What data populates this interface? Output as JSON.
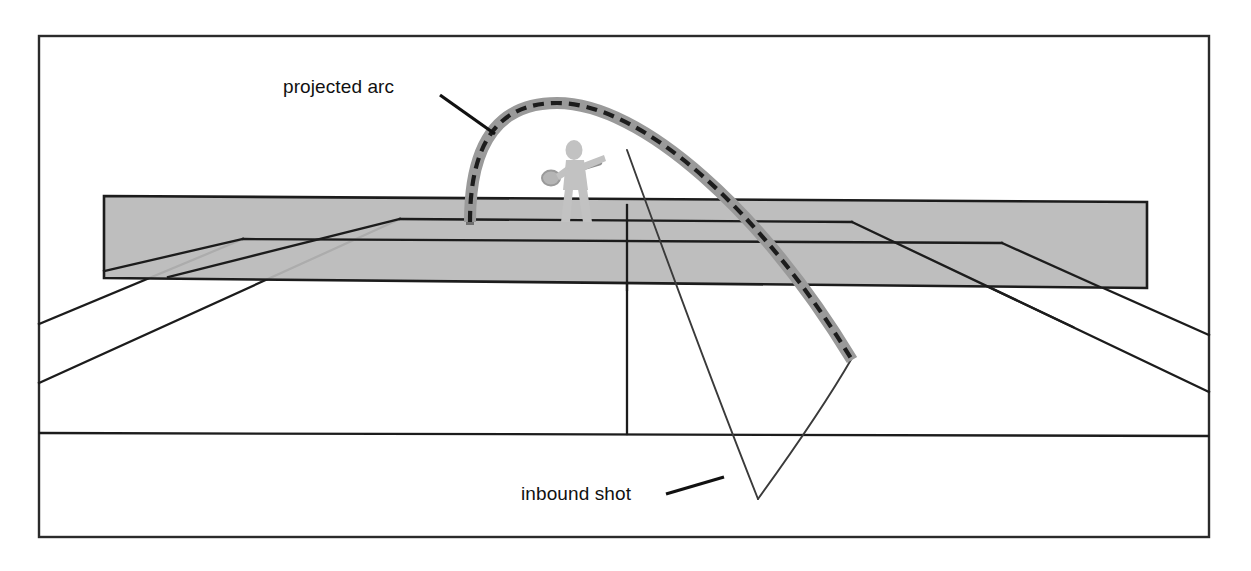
{
  "diagram": {
    "background_color": "#ffffff",
    "border": {
      "name": "outer-frame",
      "color": "#2b2b2b",
      "x": 39,
      "y": 36,
      "width": 1170,
      "height": 501,
      "stroke_width": 2.4
    },
    "annotations": [
      {
        "id": "projected-arc",
        "label": "projected arc",
        "text_x": 283,
        "text_y": 93,
        "leader_x1": 440,
        "leader_y1": 95,
        "leader_x2": 493,
        "leader_y2": 133,
        "color": "#111111"
      },
      {
        "id": "inbound-shot",
        "label": "inbound shot",
        "text_x": 521,
        "text_y": 500,
        "leader_x1": 667,
        "leader_y1": 493,
        "leader_x2": 722,
        "leader_y2": 477,
        "color": "#111111"
      }
    ],
    "net": {
      "name": "tennis-net",
      "fill": "#b8b8b8",
      "stroke": "#1c1c1c",
      "stroke_width": 2.6,
      "points": "104,196 1147,202 1147,288 104,278",
      "top_left": [
        104,
        196
      ],
      "top_right": [
        1147,
        202
      ],
      "bottom_right": [
        1147,
        288
      ],
      "bottom_left": [
        104,
        278
      ]
    },
    "court_lines": {
      "stroke": "#1c1c1c",
      "stroke_width": 2.3,
      "near_baseline": {
        "name": "near-baseline",
        "x1": 39,
        "y1": 433,
        "x2": 1209,
        "y2": 436
      },
      "center_service_line": {
        "name": "center-service-line",
        "x1": 627,
        "y1": 212,
        "x2": 627,
        "y2": 434
      },
      "far_service_line": {
        "name": "far-service-line",
        "x1": 400,
        "y1": 219,
        "x2": 852,
        "y2": 222
      },
      "far_baseline_band": {
        "name": "far-baseline",
        "x1": 243,
        "y1": 239,
        "x2": 1002,
        "y2": 243
      },
      "left_singles_sideline": {
        "name": "left-singles-sideline",
        "x1": 39,
        "y1": 383,
        "x2": 400,
        "y2": 219
      },
      "left_doubles_sideline": {
        "name": "left-doubles-sideline",
        "x1": 39,
        "y1": 324,
        "x2": 243,
        "y2": 239
      },
      "right_singles_sideline": {
        "name": "right-singles-sideline",
        "x1": 852,
        "y1": 222,
        "x2": 1209,
        "y2": 392
      },
      "right_doubles_sideline": {
        "name": "right-doubles-sideline",
        "x1": 1002,
        "y1": 243,
        "x2": 1209,
        "y2": 335
      },
      "left_service_box_edge": {
        "name": "left-service-box-edge",
        "x1": 400,
        "y1": 219,
        "x2": 627,
        "y2": 219
      },
      "right_service_box_edge": {
        "name": "right-service-box-edge",
        "x1": 627,
        "y1": 220,
        "x2": 852,
        "y2": 222
      }
    },
    "projected_arc": {
      "name": "projected-arc-path",
      "style": "dashed line with gray halo",
      "halo_color": "#999999",
      "halo_width": 11,
      "dash_color": "#1c1c1c",
      "dash_width": 4,
      "dash_pattern": "11 7",
      "start": [
        470,
        222
      ],
      "apex": [
        556,
        103
      ],
      "end": [
        852,
        360
      ],
      "path": "M 470 222 C 470 140 500 103 556 103 C 640 103 760 210 852 360"
    },
    "inbound_shot": {
      "name": "inbound-shot-path",
      "stroke": "#3a3a3a",
      "stroke_width": 1.8,
      "descent_start": [
        627,
        150
      ],
      "bounce_point": [
        758,
        499
      ],
      "rise_end": [
        852,
        358
      ],
      "descent_path": "M 627 150 C 668 262 718 396 758 499",
      "rise_path": "M 758 499 C 790 455 824 404 852 358"
    },
    "player": {
      "name": "tennis-player-silhouette",
      "fill": "#c2c2c2",
      "position_x": 560,
      "position_y": 145,
      "height": 80,
      "racket": {
        "name": "tennis-racket",
        "stroke": "#8f8f8f",
        "head_center": [
          552,
          178
        ],
        "head_rx": 9,
        "head_ry": 7
      }
    },
    "net_posts": [
      {
        "name": "net-post-left",
        "x": 470,
        "y_top": 205,
        "y_bottom": 224
      },
      {
        "name": "net-post-center",
        "x": 627,
        "y_top": 202,
        "y_bottom": 212
      }
    ]
  }
}
